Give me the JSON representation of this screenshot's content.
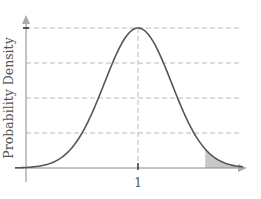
{
  "chart_data": {
    "type": "area",
    "title": "",
    "xlabel": "",
    "ylabel": "Probability Density",
    "x_ticks": [
      {
        "value": 1,
        "label": "1"
      }
    ],
    "y_ticks": [],
    "distribution": "normal",
    "mean": 1,
    "std": 0.3,
    "xlim": [
      -0.4,
      2.3
    ],
    "ylim": [
      0,
      1.45
    ],
    "peak_density": 1.33,
    "grid": {
      "horizontal": true,
      "vertical_at_mean": true,
      "style": "dashed",
      "levels_fraction_of_peak": [
        0.25,
        0.5,
        0.75,
        1.0
      ]
    },
    "shaded_region": {
      "from": 1.6,
      "to": 2.3,
      "description": "right tail area"
    },
    "legend": null,
    "colors": {
      "curve": "#555555",
      "axis": "#888888",
      "grid": "#bbbbbb",
      "shade": "#c8c8c8",
      "text": "#555555"
    }
  }
}
